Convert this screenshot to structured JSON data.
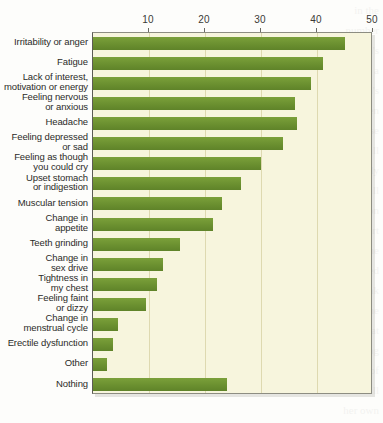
{
  "chart_data": {
    "type": "bar",
    "orientation": "horizontal",
    "title": "",
    "subtitle": "",
    "xlabel": "",
    "ylabel": "",
    "xlim": [
      0,
      50
    ],
    "ylim": null,
    "grid": true,
    "legend": null,
    "tick_labels": [
      "10",
      "20",
      "30",
      "40",
      "50"
    ],
    "tick_values": [
      10,
      20,
      30,
      40,
      50
    ],
    "categories": [
      "Irritability or anger",
      "Fatigue",
      "Lack of interest,\nmotivation or energy",
      "Feeling nervous\nor anxious",
      "Headache",
      "Feeling depressed\nor sad",
      "Feeling as though\nyou could cry",
      "Upset stomach\nor indigestion",
      "Muscular tension",
      "Change in\nappetite",
      "Teeth grinding",
      "Change in\nsex drive",
      "Tightness in\nmy chest",
      "Feeling faint\nor dizzy",
      "Change in\nmenstrual cycle",
      "Erectile dysfunction",
      "Other",
      "Nothing"
    ],
    "values": [
      45,
      41,
      39,
      36,
      36.5,
      34,
      30,
      26.5,
      23,
      21.5,
      15.5,
      12.5,
      11.5,
      9.5,
      4.5,
      3.5,
      2.5,
      24
    ],
    "bar_color": "#6f9432",
    "plot_background": "#f7f5dd",
    "gridline_color": "#ded9b0"
  },
  "bleed_text": [
    "in the",
    "number",
    "a man's",
    "how a",
    "person's",
    "of a broken",
    "because",
    "on it will",
    "he is actually",
    "who will",
    "a person",
    "of a heart",
    "become",
    "worried",
    "the weak",
    "become",
    "science show that",
    "sign of being",
    "the day of",
    "she will",
    "her own"
  ]
}
